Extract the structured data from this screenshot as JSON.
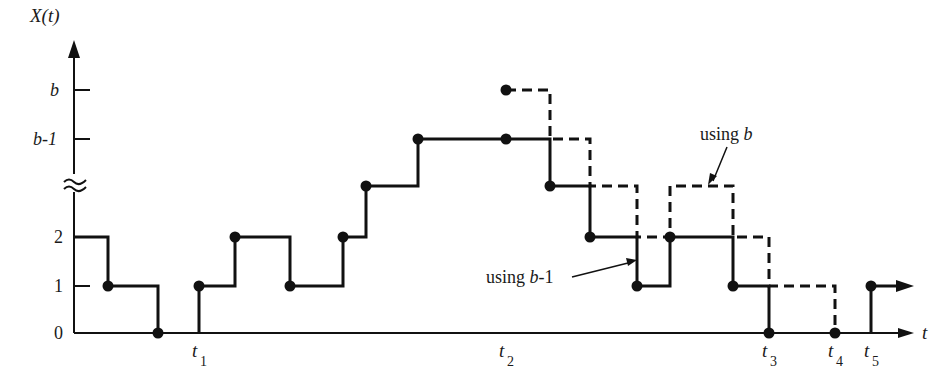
{
  "diagram": {
    "type": "step-process-sample-path",
    "y_axis_label": "X(t)",
    "x_axis_label": "t",
    "y_ticks": [
      {
        "label": "0",
        "y": 333
      },
      {
        "label": "1",
        "y": 286
      },
      {
        "label": "2",
        "y": 237
      },
      {
        "label": "b-1",
        "y": 139
      },
      {
        "label": "b",
        "y": 90
      }
    ],
    "x_ticks": [
      {
        "label": "t",
        "sub": "1",
        "x": 199
      },
      {
        "label": "t",
        "sub": "2",
        "x": 506
      },
      {
        "label": "t",
        "sub": "3",
        "x": 769
      },
      {
        "label": "t",
        "sub": "4",
        "x": 835
      },
      {
        "label": "t",
        "sub": "5",
        "x": 871
      }
    ],
    "annotations": [
      {
        "text_prefix": "using ",
        "text_var": "b",
        "target": "dashed path"
      },
      {
        "text_prefix": "using ",
        "text_var": "b",
        "text_suffix": "-1",
        "target": "solid path"
      }
    ],
    "solid_path": "M74,237 H108 V286 H158 V333 M199,333 V286 H235 V237 H290 V286 H343 V237 H366 V186 H418 V139 H550 V186 H590 V237 H637 V286 H670 V237 H733 V286 H769 V333 M871,333 V286 H905",
    "dashed_path": "M506,90 H550 V139 H590 V186 H637 V237 H670 V186 H733 V237 H769 V286 H835 V333",
    "solid_dots": [
      [
        108,
        286
      ],
      [
        158,
        333
      ],
      [
        199,
        286
      ],
      [
        235,
        237
      ],
      [
        290,
        286
      ],
      [
        343,
        237
      ],
      [
        366,
        186
      ],
      [
        418,
        139
      ],
      [
        506,
        139
      ],
      [
        550,
        186
      ],
      [
        590,
        237
      ],
      [
        637,
        286
      ],
      [
        670,
        237
      ],
      [
        733,
        286
      ],
      [
        769,
        333
      ],
      [
        871,
        286
      ]
    ],
    "dashed_dots": [
      [
        506,
        90
      ],
      [
        835,
        333
      ]
    ]
  }
}
